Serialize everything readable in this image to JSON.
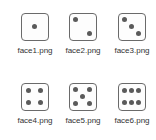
{
  "files": [
    {
      "name": "face1.png",
      "pips": 1
    },
    {
      "name": "face2.png",
      "pips": 2
    },
    {
      "name": "face3.png",
      "pips": 3
    },
    {
      "name": "face4.png",
      "pips": 4
    },
    {
      "name": "face5.png",
      "pips": 5
    },
    {
      "name": "face6.png",
      "pips": 6
    }
  ]
}
